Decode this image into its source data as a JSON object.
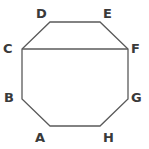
{
  "figure": {
    "name": "octagon-ABCDEFGH",
    "canvas": {
      "width": 149,
      "height": 149
    },
    "background_color": "#ffffff",
    "stroke_color": "#5a5a5a",
    "stroke_width": 1.3,
    "fill": "none",
    "label_color": "#3a3a3a",
    "label_font_size": 13,
    "vertices": [
      {
        "id": "A",
        "label": "A",
        "x": 50,
        "y": 126,
        "label_x": 35,
        "label_y": 131
      },
      {
        "id": "B",
        "label": "B",
        "x": 22,
        "y": 99,
        "label_x": 4,
        "label_y": 91
      },
      {
        "id": "C",
        "label": "C",
        "x": 22,
        "y": 49,
        "label_x": 3,
        "label_y": 42
      },
      {
        "id": "D",
        "label": "D",
        "x": 50,
        "y": 22,
        "label_x": 36,
        "label_y": 7
      },
      {
        "id": "E",
        "label": "E",
        "x": 100,
        "y": 22,
        "label_x": 103,
        "label_y": 7
      },
      {
        "id": "F",
        "label": "F",
        "x": 128,
        "y": 49,
        "label_x": 131,
        "label_y": 42
      },
      {
        "id": "G",
        "label": "G",
        "x": 128,
        "y": 99,
        "label_x": 131,
        "label_y": 91
      },
      {
        "id": "H",
        "label": "H",
        "x": 100,
        "y": 126,
        "label_x": 103,
        "label_y": 131
      }
    ],
    "outline_path": "M 50 126 L 22 99 L 22 49 L 50 22 L 100 22 L 128 49 L 128 99 L 100 126 Z",
    "chord": {
      "name": "chord-C-F",
      "from": "C",
      "to": "F",
      "x1": 22,
      "y1": 49,
      "x2": 128,
      "y2": 49
    }
  }
}
